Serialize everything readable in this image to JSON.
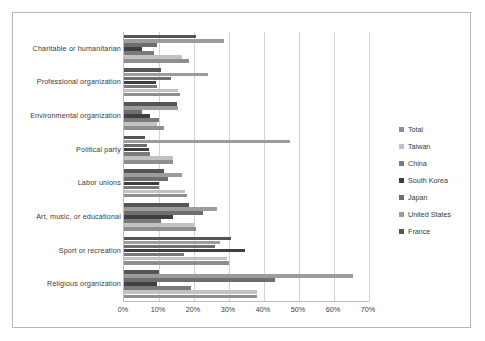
{
  "chart_data": {
    "type": "bar",
    "orientation": "horizontal",
    "title": "",
    "subtitle": "",
    "xlabel": "",
    "ylabel": "",
    "xlim": [
      0,
      70
    ],
    "xtick_labels": [
      "0%",
      "10%",
      "20%",
      "30%",
      "40%",
      "50%",
      "60%",
      "70%"
    ],
    "xtick_values": [
      0,
      10,
      20,
      30,
      40,
      50,
      60,
      70
    ],
    "grid": "vertical",
    "legend_position": "right",
    "categories": [
      "Charitable or humanitarian",
      "Professional organization",
      "Environmental organization",
      "Political party",
      "Labor unions",
      "Art, music, or educational",
      "Sport or recreation",
      "Religious organization"
    ],
    "series": [
      {
        "name": "Total",
        "color": "#8e8e8e",
        "values": [
          18.5,
          16.0,
          11.5,
          14.0,
          18.0,
          20.5,
          30.0,
          38.0
        ]
      },
      {
        "name": "Taiwan",
        "color": "#c2c2c2",
        "values": [
          16.5,
          15.5,
          9.5,
          14.0,
          17.5,
          20.0,
          29.5,
          38.0
        ]
      },
      {
        "name": "China",
        "color": "#7a7a7a",
        "values": [
          8.5,
          9.5,
          10.0,
          7.5,
          10.0,
          10.5,
          17.0,
          19.0
        ]
      },
      {
        "name": "South Korea",
        "color": "#3f3f3f",
        "values": [
          5.0,
          9.0,
          7.5,
          7.0,
          10.0,
          14.0,
          34.5,
          9.5
        ]
      },
      {
        "name": "Japan",
        "color": "#6e6e6e",
        "values": [
          9.5,
          13.5,
          5.0,
          6.5,
          12.5,
          22.5,
          26.0,
          43.0
        ]
      },
      {
        "name": "United States",
        "color": "#9c9c9c",
        "values": [
          28.5,
          24.0,
          15.5,
          47.5,
          16.5,
          26.5,
          27.5,
          65.5
        ]
      },
      {
        "name": "France",
        "color": "#555555",
        "values": [
          20.5,
          10.5,
          15.0,
          6.0,
          11.5,
          18.5,
          30.5,
          10.0
        ]
      }
    ]
  },
  "legend": {
    "items": [
      {
        "label": "Total"
      },
      {
        "label": "Taiwan"
      },
      {
        "label": "China"
      },
      {
        "label": "South Korea"
      },
      {
        "label": "Japan"
      },
      {
        "label": "United States"
      },
      {
        "label": "France"
      }
    ]
  }
}
